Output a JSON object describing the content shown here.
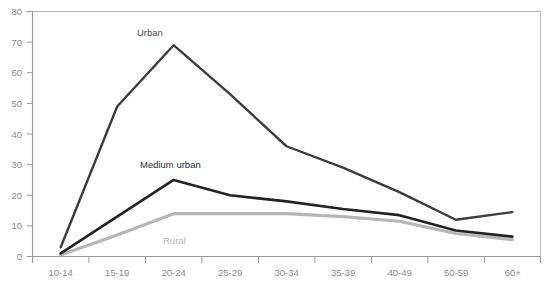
{
  "chart_data": {
    "type": "line",
    "title": "",
    "subtitle": "",
    "xlabel": "",
    "ylabel": "",
    "categories": [
      "10-14",
      "15-19",
      "20-24",
      "25-29",
      "30-34",
      "35-39",
      "40-49",
      "50-59",
      "60+"
    ],
    "ylim": [
      0,
      80
    ],
    "yticks": [
      0,
      10,
      20,
      30,
      40,
      50,
      60,
      70,
      80
    ],
    "grid": false,
    "legend_position": "inline-labels",
    "series": [
      {
        "name": "Urban",
        "color": "#3d3d3d",
        "values": [
          3,
          49,
          69,
          53,
          36,
          29,
          21,
          12,
          14.5
        ]
      },
      {
        "name": "Medium urban",
        "color": "#232323",
        "values": [
          1,
          13,
          25,
          20,
          18,
          15.5,
          13.5,
          8.5,
          6.5
        ]
      },
      {
        "name": "Rural",
        "color": "#b6b6b6",
        "values": [
          0.5,
          7,
          14,
          14,
          14,
          13,
          11.5,
          7.5,
          5.5
        ]
      }
    ],
    "axis_color": "#9a9a9a",
    "tick_label_color": "#8a8a8a",
    "background": "#ffffff"
  },
  "axis": {
    "y_ticks": [
      {
        "label": "80"
      },
      {
        "label": "70"
      },
      {
        "label": "60"
      },
      {
        "label": "50"
      },
      {
        "label": "40"
      },
      {
        "label": "30"
      },
      {
        "label": "20"
      },
      {
        "label": "10"
      },
      {
        "label": "0"
      }
    ],
    "x_ticks": [
      {
        "label": "10-14"
      },
      {
        "label": "15-19"
      },
      {
        "label": "20-24"
      },
      {
        "label": "25-29"
      },
      {
        "label": "30-34"
      },
      {
        "label": "35-39"
      },
      {
        "label": "40-49"
      },
      {
        "label": "50-59"
      },
      {
        "label": "60+"
      }
    ]
  },
  "annotations": {
    "urban": "Urban",
    "medium_urban": "Medium urban",
    "rural": "Rural"
  }
}
